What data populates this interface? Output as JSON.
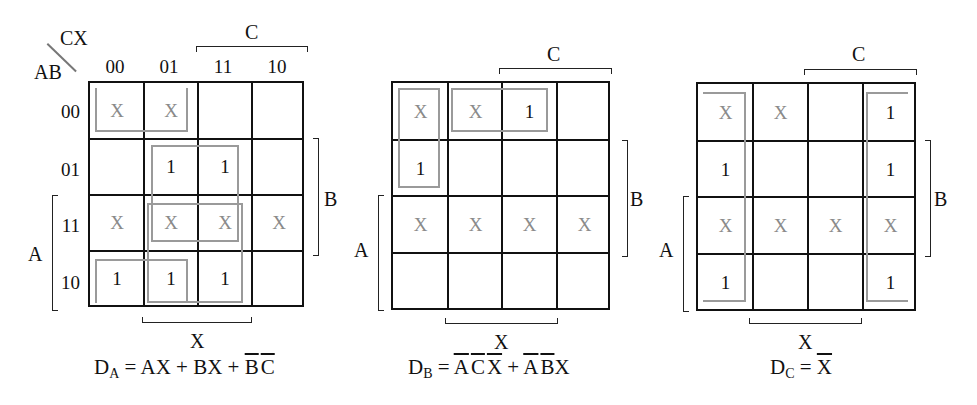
{
  "axis_labels": {
    "columns_var": "CX",
    "rows_var": "AB"
  },
  "column_headers": [
    "00",
    "01",
    "11",
    "10"
  ],
  "row_headers": [
    "00",
    "01",
    "11",
    "10"
  ],
  "bracket_labels": {
    "top": "C",
    "right": "B",
    "left": "A",
    "bottom": "X"
  },
  "maps": [
    {
      "name": "DA",
      "cells": [
        [
          "X",
          "X",
          "",
          ""
        ],
        [
          "",
          "1",
          "1",
          ""
        ],
        [
          "X",
          "X",
          "X",
          "X"
        ],
        [
          "1",
          "1",
          "1",
          ""
        ]
      ],
      "groups": [
        "B'C' (row00+row10, cols 00,01)",
        "BX (rows 01,11, cols 01,11)",
        "AX (rows 11,10, cols 01,11)"
      ],
      "equation": {
        "lhs": "D",
        "sub": "A",
        "eq": " = ",
        "terms": [
          "AX",
          " + ",
          "BX",
          " + ",
          "B",
          "C"
        ]
      }
    },
    {
      "name": "DB",
      "cells": [
        [
          "X",
          "X",
          "1",
          ""
        ],
        [
          "1",
          "",
          "",
          ""
        ],
        [
          "X",
          "X",
          "X",
          "X"
        ],
        [
          "",
          "",
          "",
          ""
        ]
      ],
      "groups": [
        "A'B'X (row 00, cols 01,11)",
        "A'C'X' (rows 00,01, col 00)"
      ],
      "equation": {
        "lhs": "D",
        "sub": "B",
        "eq": " = ",
        "t1": [
          "A",
          "C",
          "X"
        ],
        "plus": " + ",
        "t2a": "A",
        "t2b": "B",
        "t2c": "X"
      }
    },
    {
      "name": "DC",
      "cells": [
        [
          "X",
          "X",
          "",
          "1"
        ],
        [
          "1",
          "",
          "",
          "1"
        ],
        [
          "X",
          "X",
          "X",
          "X"
        ],
        [
          "1",
          "",
          "",
          "1"
        ]
      ],
      "groups": [
        "X' (cols 00 and 10, all rows, wraparound)"
      ],
      "equation": {
        "lhs": "D",
        "sub": "C",
        "eq": " = ",
        "t1": "X"
      }
    }
  ]
}
